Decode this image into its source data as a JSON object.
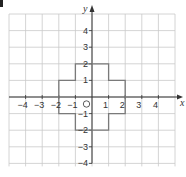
{
  "chart_data": {
    "type": "line",
    "title": "",
    "xlabel": "x",
    "ylabel": "y",
    "xlim": [
      -5,
      5
    ],
    "ylim": [
      -4,
      5
    ],
    "grid": true,
    "origin_label": "O",
    "x_ticks": [
      -4,
      -3,
      -2,
      -1,
      1,
      2,
      3,
      4
    ],
    "y_ticks": [
      4,
      3,
      2,
      1,
      -1,
      -2,
      -3,
      -4
    ],
    "x_tick_labels": [
      "−4",
      "−3",
      "−2",
      "−1",
      "1",
      "2",
      "3",
      "4"
    ],
    "y_tick_labels": [
      "4",
      "3",
      "2",
      "1",
      "−1",
      "−2",
      "−3",
      "−4"
    ],
    "series": [
      {
        "name": "cross-shape",
        "closed": true,
        "points": [
          [
            -1,
            2
          ],
          [
            1,
            2
          ],
          [
            1,
            1
          ],
          [
            2,
            1
          ],
          [
            2,
            -1
          ],
          [
            1,
            -1
          ],
          [
            1,
            -2
          ],
          [
            -1,
            -2
          ],
          [
            -1,
            -1
          ],
          [
            -2,
            -1
          ],
          [
            -2,
            1
          ],
          [
            -1,
            1
          ]
        ]
      }
    ],
    "colors": {
      "grid": "#c9c9c9",
      "axis": "#333333",
      "shape": "#7a7a7a"
    }
  }
}
